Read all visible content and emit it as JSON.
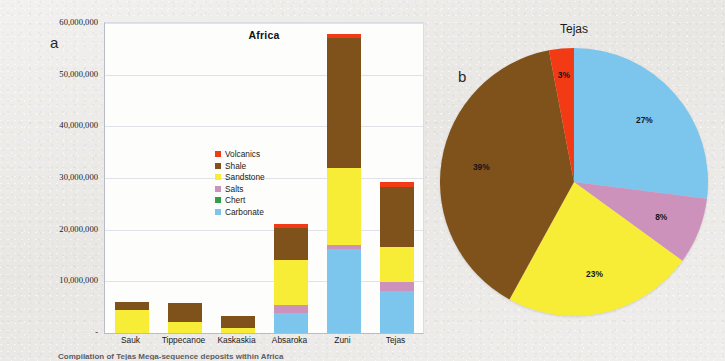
{
  "figure": {
    "panel_a_letter": "a",
    "panel_b_letter": "b",
    "caption": "Compilation of Tejas Mega-sequence deposits within Africa"
  },
  "colors": {
    "volcanics": "#f23b14",
    "shale": "#80521b",
    "sandstone": "#f7ec36",
    "salts": "#cd92bb",
    "chert": "#2e9e47",
    "carbonate": "#7cc5ec",
    "background": "#eceae8",
    "plot_background": "#fdfdfc",
    "gridline": "#dfe2e8",
    "axis": "#b9bcc4",
    "text": "#1b1b20"
  },
  "legend": {
    "items": [
      {
        "label": "Volcanics",
        "color_key": "volcanics"
      },
      {
        "label": "Shale",
        "color_key": "shale"
      },
      {
        "label": "Sandstone",
        "color_key": "sandstone"
      },
      {
        "label": "Salts",
        "color_key": "salts"
      },
      {
        "label": "Chert",
        "color_key": "chert"
      },
      {
        "label": "Carbonate",
        "color_key": "carbonate"
      }
    ]
  },
  "chart_data": [
    {
      "id": "bar-chart-africa",
      "type": "bar",
      "stacked": true,
      "title": "Africa",
      "xlabel": "",
      "ylabel": "",
      "ylim": [
        0,
        60000000
      ],
      "ytick_step": 10000000,
      "ytick_labels": [
        "-",
        "10,000,000",
        "20,000,000",
        "30,000,000",
        "40,000,000",
        "50,000,000",
        "60,000,000"
      ],
      "grid": true,
      "legend_position": "inside-left",
      "categories": [
        "Sauk",
        "Tippecanoe",
        "Kaskaskia",
        "Absaroka",
        "Zuni",
        "Tejas"
      ],
      "series": [
        {
          "name": "Carbonate",
          "color_key": "carbonate",
          "values": [
            0,
            0,
            0,
            3900000,
            16200000,
            8100000
          ]
        },
        {
          "name": "Chert",
          "color_key": "chert",
          "values": [
            0,
            0,
            0,
            0,
            0,
            0
          ]
        },
        {
          "name": "Salts",
          "color_key": "salts",
          "values": [
            0,
            0,
            0,
            1600000,
            900000,
            1700000
          ]
        },
        {
          "name": "Sandstone",
          "color_key": "sandstone",
          "values": [
            4400000,
            2200000,
            900000,
            8600000,
            14900000,
            6800000
          ]
        },
        {
          "name": "Shale",
          "color_key": "shale",
          "values": [
            1700000,
            3700000,
            2400000,
            6300000,
            25100000,
            11700000
          ]
        },
        {
          "name": "Volcanics",
          "color_key": "volcanics",
          "values": [
            0,
            0,
            0,
            700000,
            700000,
            900000
          ]
        }
      ],
      "totals": [
        6100000,
        5900000,
        3300000,
        21100000,
        57800000,
        29200000
      ]
    },
    {
      "id": "pie-chart-tejas",
      "type": "pie",
      "title": "Tejas",
      "start_angle_deg": 0,
      "labels": [
        "Carbonate",
        "Salts",
        "Sandstone",
        "Shale",
        "Volcanics"
      ],
      "values": [
        27,
        8,
        23,
        39,
        3
      ],
      "color_keys": [
        "carbonate",
        "salts",
        "sandstone",
        "shale",
        "volcanics"
      ],
      "display_labels": [
        "27%",
        "8%",
        "23%",
        "39%",
        "3%"
      ]
    }
  ]
}
